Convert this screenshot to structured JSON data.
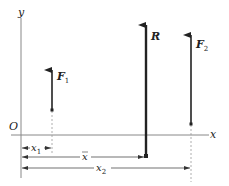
{
  "diagram": {
    "axes": {
      "y_label": "y",
      "x_label": "x",
      "origin_label": "O"
    },
    "forces": [
      {
        "name": "F",
        "sub": "1",
        "x": 52,
        "top": 68,
        "bottom": 110
      },
      {
        "name": "R",
        "sub": "",
        "x": 146,
        "top": 23,
        "bottom": 156
      },
      {
        "name": "F",
        "sub": "2",
        "x": 191,
        "top": 33,
        "bottom": 124
      }
    ],
    "dimensions": [
      {
        "name": "x",
        "sub": "1",
        "bar": false
      },
      {
        "name": "x",
        "sub": "",
        "bar": true
      },
      {
        "name": "x",
        "sub": "2",
        "bar": false
      }
    ],
    "colors": {
      "axis": "#888888",
      "arrow": "#222222",
      "text": "#222222"
    }
  }
}
